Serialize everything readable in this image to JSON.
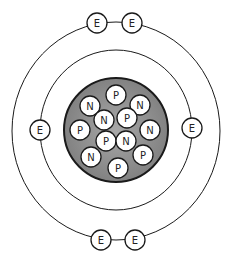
{
  "diagram": {
    "colors": {
      "nucleus_fill": "#8f8f8f",
      "stroke": "#1a1a1a",
      "particle_fill": "#ffffff"
    },
    "nucleus": {
      "cx": 116,
      "cy": 130,
      "r": 52,
      "particles": [
        {
          "label": "P",
          "x": 116,
          "y": 95
        },
        {
          "label": "N",
          "x": 90,
          "y": 106
        },
        {
          "label": "N",
          "x": 140,
          "y": 105
        },
        {
          "label": "N",
          "x": 104,
          "y": 120
        },
        {
          "label": "P",
          "x": 127,
          "y": 118
        },
        {
          "label": "P",
          "x": 80,
          "y": 130
        },
        {
          "label": "N",
          "x": 150,
          "y": 130
        },
        {
          "label": "P",
          "x": 106,
          "y": 141
        },
        {
          "label": "N",
          "x": 126,
          "y": 141
        },
        {
          "label": "N",
          "x": 91,
          "y": 157
        },
        {
          "label": "P",
          "x": 143,
          "y": 155
        },
        {
          "label": "P",
          "x": 118,
          "y": 168
        }
      ]
    },
    "orbits": [
      {
        "name": "inner",
        "cx": 116,
        "cy": 130,
        "rx": 76,
        "ry": 80,
        "electrons": [
          {
            "label": "E",
            "x": 40,
            "y": 130
          },
          {
            "label": "E",
            "x": 192,
            "y": 128
          }
        ]
      },
      {
        "name": "outer",
        "cx": 116,
        "cy": 131,
        "rx": 104,
        "ry": 109,
        "electrons": [
          {
            "label": "E",
            "x": 97,
            "y": 23
          },
          {
            "label": "E",
            "x": 132,
            "y": 23
          },
          {
            "label": "E",
            "x": 101,
            "y": 240
          },
          {
            "label": "E",
            "x": 135,
            "y": 240
          }
        ]
      }
    ]
  }
}
